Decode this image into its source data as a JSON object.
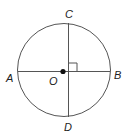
{
  "diagram": {
    "type": "circle-with-perpendicular-chords",
    "labels": {
      "top": "C",
      "bottom": "D",
      "left": "A",
      "right": "B",
      "center": "O"
    },
    "colors": {
      "stroke": "#555555",
      "dot": "#111111",
      "text": "#222222"
    }
  }
}
